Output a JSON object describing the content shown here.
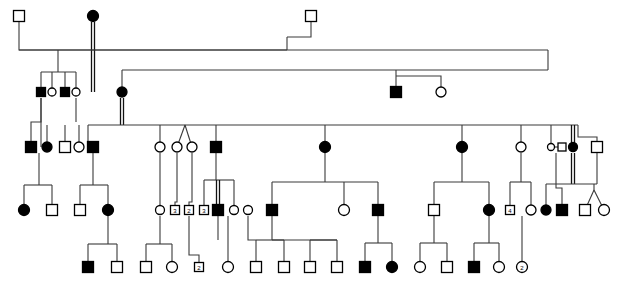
{
  "figure": {
    "kind": "pedigree",
    "width": 620,
    "height": 283,
    "background": "#ffffff",
    "line_color": "#3a3a3a",
    "symbol_stroke": "#000000",
    "affected_fill": "#000000",
    "unaffected_fill": "#ffffff",
    "legend": {
      "filled_square": "affected male",
      "open_square": "unaffected male",
      "filled_circle": "affected female",
      "open_circle": "unaffected female",
      "numbered_symbol": "sibship count"
    }
  },
  "generations": [
    {
      "id": "I",
      "label": "I",
      "y": 16
    },
    {
      "id": "II",
      "label": "II",
      "y": 92
    },
    {
      "id": "III",
      "label": "III",
      "y": 147
    },
    {
      "id": "IV",
      "label": "IV",
      "y": 210
    },
    {
      "id": "V",
      "label": "V",
      "y": 267
    }
  ],
  "individuals": [
    {
      "id": "I-1",
      "gen": "I",
      "shape": "square",
      "status": "open",
      "x": 19,
      "y": 16,
      "size": 11,
      "label": ""
    },
    {
      "id": "I-2",
      "gen": "I",
      "shape": "circle",
      "status": "filled",
      "x": 93,
      "y": 16,
      "size": 11,
      "label": ""
    },
    {
      "id": "I-3",
      "gen": "I",
      "shape": "square",
      "status": "open",
      "x": 311,
      "y": 16,
      "size": 11,
      "label": ""
    },
    {
      "id": "II-1",
      "gen": "II",
      "shape": "square",
      "status": "filled",
      "x": 41,
      "y": 92,
      "size": 9,
      "label": ""
    },
    {
      "id": "II-2",
      "gen": "II",
      "shape": "circle",
      "status": "open",
      "x": 52,
      "y": 92,
      "size": 8,
      "label": ""
    },
    {
      "id": "II-3",
      "gen": "II",
      "shape": "square",
      "status": "filled",
      "x": 65,
      "y": 92,
      "size": 9,
      "label": ""
    },
    {
      "id": "II-4",
      "gen": "II",
      "shape": "circle",
      "status": "open",
      "x": 76,
      "y": 92,
      "size": 8,
      "label": ""
    },
    {
      "id": "II-5",
      "gen": "II",
      "shape": "circle",
      "status": "filled",
      "x": 122,
      "y": 92,
      "size": 10,
      "label": ""
    },
    {
      "id": "II-6",
      "gen": "II",
      "shape": "square",
      "status": "filled",
      "x": 396,
      "y": 92,
      "size": 11,
      "label": ""
    },
    {
      "id": "II-7",
      "gen": "II",
      "shape": "circle",
      "status": "open",
      "x": 441,
      "y": 92,
      "size": 10,
      "label": ""
    },
    {
      "id": "III-1",
      "gen": "III",
      "shape": "square",
      "status": "filled",
      "x": 31,
      "y": 147,
      "size": 11,
      "label": ""
    },
    {
      "id": "III-2",
      "gen": "III",
      "shape": "circle",
      "status": "filled",
      "x": 47,
      "y": 147,
      "size": 10,
      "label": ""
    },
    {
      "id": "III-3",
      "gen": "III",
      "shape": "square",
      "status": "open",
      "x": 65,
      "y": 147,
      "size": 11,
      "label": ""
    },
    {
      "id": "III-4",
      "gen": "III",
      "shape": "circle",
      "status": "open",
      "x": 79,
      "y": 147,
      "size": 10,
      "label": ""
    },
    {
      "id": "III-5",
      "gen": "III",
      "shape": "square",
      "status": "filled",
      "x": 93,
      "y": 147,
      "size": 11,
      "label": ""
    },
    {
      "id": "III-6",
      "gen": "III",
      "shape": "circle",
      "status": "open",
      "x": 160,
      "y": 147,
      "size": 10,
      "label": ""
    },
    {
      "id": "III-7",
      "gen": "III",
      "shape": "circle",
      "status": "open",
      "x": 177,
      "y": 147,
      "size": 10,
      "label": ""
    },
    {
      "id": "III-8",
      "gen": "III",
      "shape": "circle",
      "status": "open",
      "x": 192,
      "y": 147,
      "size": 10,
      "label": ""
    },
    {
      "id": "III-9",
      "gen": "III",
      "shape": "square",
      "status": "filled",
      "x": 216,
      "y": 147,
      "size": 11,
      "label": ""
    },
    {
      "id": "III-10",
      "gen": "III",
      "shape": "circle",
      "status": "filled",
      "x": 325,
      "y": 147,
      "size": 11,
      "label": ""
    },
    {
      "id": "III-11",
      "gen": "III",
      "shape": "circle",
      "status": "filled",
      "x": 462,
      "y": 147,
      "size": 11,
      "label": ""
    },
    {
      "id": "III-12",
      "gen": "III",
      "shape": "circle",
      "status": "open",
      "x": 521,
      "y": 147,
      "size": 10,
      "label": ""
    },
    {
      "id": "III-13",
      "gen": "III",
      "shape": "circle",
      "status": "open",
      "x": 551,
      "y": 147,
      "size": 7,
      "label": ""
    },
    {
      "id": "III-14",
      "gen": "III",
      "shape": "square",
      "status": "open",
      "x": 562,
      "y": 147,
      "size": 8,
      "label": ""
    },
    {
      "id": "III-15",
      "gen": "III",
      "shape": "circle",
      "status": "filled",
      "x": 573,
      "y": 147,
      "size": 9,
      "label": ""
    },
    {
      "id": "III-16",
      "gen": "III",
      "shape": "square",
      "status": "open",
      "x": 597,
      "y": 147,
      "size": 11,
      "label": ""
    },
    {
      "id": "IV-1",
      "gen": "IV",
      "shape": "circle",
      "status": "filled",
      "x": 24,
      "y": 210,
      "size": 11,
      "label": ""
    },
    {
      "id": "IV-2",
      "gen": "IV",
      "shape": "square",
      "status": "open",
      "x": 52,
      "y": 210,
      "size": 11,
      "label": ""
    },
    {
      "id": "IV-3",
      "gen": "IV",
      "shape": "square",
      "status": "open",
      "x": 80,
      "y": 210,
      "size": 11,
      "label": ""
    },
    {
      "id": "IV-4",
      "gen": "IV",
      "shape": "circle",
      "status": "filled",
      "x": 108,
      "y": 210,
      "size": 11,
      "label": ""
    },
    {
      "id": "IV-5",
      "gen": "IV",
      "shape": "circle",
      "status": "open",
      "x": 160,
      "y": 210,
      "size": 9,
      "label": ""
    },
    {
      "id": "IV-6",
      "gen": "IV",
      "shape": "square",
      "status": "open",
      "x": 175,
      "y": 210,
      "size": 9,
      "label": "3"
    },
    {
      "id": "IV-7",
      "gen": "IV",
      "shape": "square",
      "status": "open",
      "x": 189,
      "y": 210,
      "size": 9,
      "label": "2"
    },
    {
      "id": "IV-8",
      "gen": "IV",
      "shape": "square",
      "status": "open",
      "x": 204,
      "y": 210,
      "size": 9,
      "label": "3"
    },
    {
      "id": "IV-9",
      "gen": "IV",
      "shape": "square",
      "status": "filled",
      "x": 218,
      "y": 210,
      "size": 11,
      "label": ""
    },
    {
      "id": "IV-10",
      "gen": "IV",
      "shape": "circle",
      "status": "open",
      "x": 234,
      "y": 210,
      "size": 9,
      "label": ""
    },
    {
      "id": "IV-11",
      "gen": "IV",
      "shape": "circle",
      "status": "open",
      "x": 248,
      "y": 210,
      "size": 9,
      "label": ""
    },
    {
      "id": "IV-12",
      "gen": "IV",
      "shape": "square",
      "status": "filled",
      "x": 272,
      "y": 210,
      "size": 11,
      "label": ""
    },
    {
      "id": "IV-13",
      "gen": "IV",
      "shape": "circle",
      "status": "open",
      "x": 344,
      "y": 210,
      "size": 11,
      "label": ""
    },
    {
      "id": "IV-14",
      "gen": "IV",
      "shape": "square",
      "status": "filled",
      "x": 378,
      "y": 210,
      "size": 11,
      "label": ""
    },
    {
      "id": "IV-15",
      "gen": "IV",
      "shape": "square",
      "status": "open",
      "x": 434,
      "y": 210,
      "size": 11,
      "label": ""
    },
    {
      "id": "IV-16",
      "gen": "IV",
      "shape": "circle",
      "status": "filled",
      "x": 489,
      "y": 210,
      "size": 11,
      "label": ""
    },
    {
      "id": "IV-17",
      "gen": "IV",
      "shape": "square",
      "status": "open",
      "x": 510,
      "y": 210,
      "size": 9,
      "label": "4"
    },
    {
      "id": "IV-18",
      "gen": "IV",
      "shape": "circle",
      "status": "open",
      "x": 531,
      "y": 210,
      "size": 10,
      "label": ""
    },
    {
      "id": "IV-19",
      "gen": "IV",
      "shape": "circle",
      "status": "filled",
      "x": 546,
      "y": 210,
      "size": 10,
      "label": ""
    },
    {
      "id": "IV-20",
      "gen": "IV",
      "shape": "square",
      "status": "filled",
      "x": 562,
      "y": 210,
      "size": 11,
      "label": ""
    },
    {
      "id": "IV-21",
      "gen": "IV",
      "shape": "square",
      "status": "open",
      "x": 585,
      "y": 210,
      "size": 11,
      "label": ""
    },
    {
      "id": "IV-22",
      "gen": "IV",
      "shape": "circle",
      "status": "open",
      "x": 604,
      "y": 210,
      "size": 11,
      "label": ""
    },
    {
      "id": "V-1",
      "gen": "V",
      "shape": "square",
      "status": "filled",
      "x": 88,
      "y": 267,
      "size": 11,
      "label": ""
    },
    {
      "id": "V-2",
      "gen": "V",
      "shape": "square",
      "status": "open",
      "x": 117,
      "y": 267,
      "size": 11,
      "label": ""
    },
    {
      "id": "V-3",
      "gen": "V",
      "shape": "square",
      "status": "open",
      "x": 146,
      "y": 267,
      "size": 11,
      "label": ""
    },
    {
      "id": "V-4",
      "gen": "V",
      "shape": "circle",
      "status": "open",
      "x": 172,
      "y": 267,
      "size": 11,
      "label": ""
    },
    {
      "id": "V-5",
      "gen": "V",
      "shape": "square",
      "status": "open",
      "x": 199,
      "y": 267,
      "size": 9,
      "label": "2"
    },
    {
      "id": "V-6",
      "gen": "V",
      "shape": "circle",
      "status": "open",
      "x": 228,
      "y": 267,
      "size": 11,
      "label": ""
    },
    {
      "id": "V-7",
      "gen": "V",
      "shape": "square",
      "status": "open",
      "x": 256,
      "y": 267,
      "size": 11,
      "label": ""
    },
    {
      "id": "V-8",
      "gen": "V",
      "shape": "square",
      "status": "open",
      "x": 284,
      "y": 267,
      "size": 11,
      "label": ""
    },
    {
      "id": "V-9",
      "gen": "V",
      "shape": "square",
      "status": "open",
      "x": 310,
      "y": 267,
      "size": 11,
      "label": ""
    },
    {
      "id": "V-10",
      "gen": "V",
      "shape": "square",
      "status": "open",
      "x": 337,
      "y": 267,
      "size": 11,
      "label": ""
    },
    {
      "id": "V-11",
      "gen": "V",
      "shape": "square",
      "status": "filled",
      "x": 365,
      "y": 267,
      "size": 11,
      "label": ""
    },
    {
      "id": "V-12",
      "gen": "V",
      "shape": "circle",
      "status": "filled",
      "x": 392,
      "y": 267,
      "size": 11,
      "label": ""
    },
    {
      "id": "V-13",
      "gen": "V",
      "shape": "circle",
      "status": "open",
      "x": 420,
      "y": 267,
      "size": 11,
      "label": ""
    },
    {
      "id": "V-14",
      "gen": "V",
      "shape": "square",
      "status": "open",
      "x": 447,
      "y": 267,
      "size": 11,
      "label": ""
    },
    {
      "id": "V-15",
      "gen": "V",
      "shape": "square",
      "status": "filled",
      "x": 474,
      "y": 267,
      "size": 11,
      "label": ""
    },
    {
      "id": "V-16",
      "gen": "V",
      "shape": "circle",
      "status": "open",
      "x": 499,
      "y": 267,
      "size": 11,
      "label": ""
    },
    {
      "id": "V-17",
      "gen": "V",
      "shape": "circle",
      "status": "open",
      "x": 522,
      "y": 267,
      "size": 11,
      "label": "2"
    }
  ],
  "counts": {
    "total_individuals": 68,
    "affected": 24,
    "generations": 5
  }
}
